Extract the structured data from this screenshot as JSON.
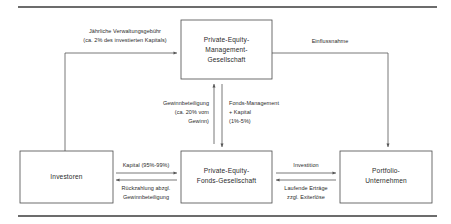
{
  "diagram": {
    "colors": {
      "background": "#ffffff",
      "box_stroke": "#4a4a4a",
      "line_stroke": "#555555",
      "rule_stroke": "#3b3b3b",
      "text": "#2b2b2b"
    },
    "rules": [
      {
        "name": "top-rule",
        "x1": 18,
        "y1": 7,
        "x2": 437,
        "y2": 7
      },
      {
        "name": "bottom-rule",
        "x1": 18,
        "y1": 216,
        "x2": 437,
        "y2": 216
      }
    ],
    "nodes": [
      {
        "id": "management",
        "lines": [
          "Private-Equity-",
          "Management-",
          "Gesellschaft"
        ],
        "x": 181,
        "y": 20,
        "w": 91,
        "h": 59
      },
      {
        "id": "investoren",
        "lines": [
          "Investoren"
        ],
        "x": 20,
        "y": 151,
        "w": 93,
        "h": 52
      },
      {
        "id": "fonds",
        "lines": [
          "Private-Equity-",
          "Fonds-Gesellschaft"
        ],
        "x": 181,
        "y": 151,
        "w": 91,
        "h": 52
      },
      {
        "id": "portfolio",
        "lines": [
          "Portfolio-",
          "Unternehmen"
        ],
        "x": 340,
        "y": 151,
        "w": 92,
        "h": 52
      }
    ],
    "edges": [
      {
        "id": "verwaltungsgebuehr",
        "from": "investoren",
        "to": "management",
        "lines": [
          "Jährliche Verwaltungsgebühr",
          "(ca. 2% des investierten Kapitals)"
        ]
      },
      {
        "id": "einflussnahme",
        "from": "management",
        "to": "portfolio",
        "lines": [
          "Einflussnahme"
        ]
      },
      {
        "id": "gewinnbeteiligung",
        "from": "fonds",
        "to": "management",
        "lines": [
          "Gewinnbeteiligung",
          "(ca. 20% vom",
          "Gewinn)"
        ]
      },
      {
        "id": "fondsmanagement",
        "from": "management",
        "to": "fonds",
        "lines": [
          "Fonds-Management",
          "+ Kapital",
          "(1%-5%)"
        ]
      },
      {
        "id": "kapital",
        "from": "investoren",
        "to": "fonds",
        "lines": [
          "Kapital (95%-99%)"
        ]
      },
      {
        "id": "rueckzahlung",
        "from": "fonds",
        "to": "investoren",
        "lines": [
          "Rückzahlung abzgl.",
          "Gewinnbeteiligung"
        ]
      },
      {
        "id": "investition",
        "from": "fonds",
        "to": "portfolio",
        "lines": [
          "Investition"
        ]
      },
      {
        "id": "ertraege",
        "from": "portfolio",
        "to": "fonds",
        "lines": [
          "Laufende Erträge",
          "zzgl. Exiterlöse"
        ]
      }
    ]
  }
}
